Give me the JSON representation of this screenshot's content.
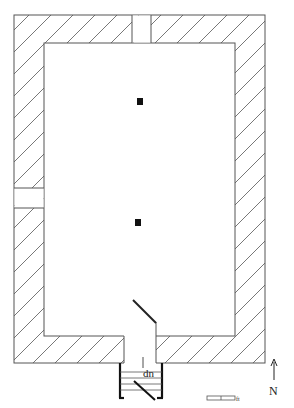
{
  "diagram": {
    "type": "architectural floor plan",
    "labels": {
      "stair_direction": "dn",
      "north": "N",
      "scale_unit": "ft"
    },
    "colors": {
      "line": "#555555",
      "hatch": "#555555",
      "solid": "#111111",
      "background": "#ffffff"
    },
    "elements": {
      "walls": "hatched masonry walls enclosing one rectangular room",
      "openings": [
        "north wall gap",
        "west wall gap",
        "south doorway with swinging door"
      ],
      "piers": 2,
      "stair": "exterior stair descending south from doorway",
      "north_arrow": true,
      "scale_bar_segments": 2
    }
  }
}
